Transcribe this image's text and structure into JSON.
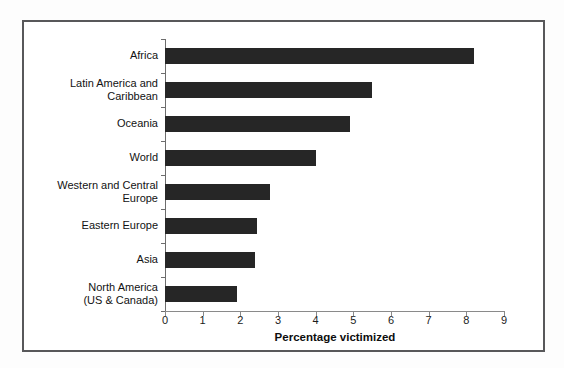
{
  "chart_data": {
    "type": "bar",
    "orientation": "horizontal",
    "title": "",
    "xlabel": "Percentage victimized",
    "ylabel": "",
    "xlim": [
      0,
      9
    ],
    "xticks": [
      "0",
      "1",
      "2",
      "3",
      "4",
      "5",
      "6",
      "7",
      "8",
      "9"
    ],
    "grid": false,
    "legend": false,
    "bar_color": "#262626",
    "categories": [
      "Africa",
      "Latin America and\nCaribbean",
      "Oceania",
      "World",
      "Western and Central\nEurope",
      "Eastern Europe",
      "Asia",
      "North America\n(US & Canada)"
    ],
    "values": [
      8.2,
      5.5,
      4.9,
      4.0,
      2.8,
      2.45,
      2.4,
      1.9
    ],
    "bars": [
      {
        "label": "Africa",
        "value": 8.2,
        "lines": 1
      },
      {
        "label": "Latin America and\nCaribbean",
        "value": 5.5,
        "lines": 2
      },
      {
        "label": "Oceania",
        "value": 4.9,
        "lines": 1
      },
      {
        "label": "World",
        "value": 4.0,
        "lines": 1
      },
      {
        "label": "Western and Central\nEurope",
        "value": 2.8,
        "lines": 2
      },
      {
        "label": "Eastern Europe",
        "value": 2.45,
        "lines": 1
      },
      {
        "label": "Asia",
        "value": 2.4,
        "lines": 1
      },
      {
        "label": "North America\n(US & Canada)",
        "value": 1.9,
        "lines": 2
      }
    ]
  }
}
